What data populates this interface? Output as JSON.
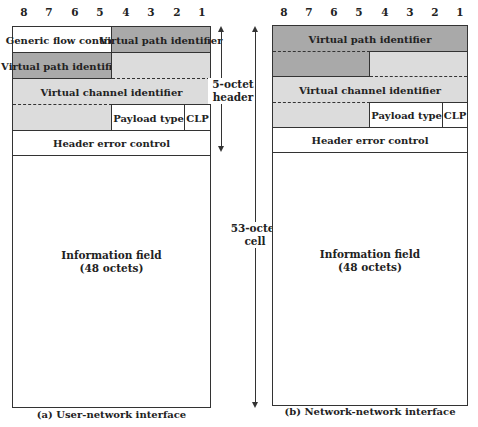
{
  "bit_labels": [
    "8",
    "7",
    "6",
    "5",
    "4",
    "3",
    "2",
    "1"
  ],
  "uni": {
    "fields": {
      "gfc": "Generic flow control",
      "vpi_a": "Virtual path identifier",
      "vpi_b": "Virtual path identifier",
      "vci": "Virtual channel identifier",
      "pt": "Payload type",
      "clp": "CLP",
      "hec": "Header error control",
      "info_line1": "Information field",
      "info_line2": "(48 octets)"
    },
    "caption": "(a) User-network interface"
  },
  "nni": {
    "fields": {
      "vpi": "Virtual path identifier",
      "vci": "Virtual channel identifier",
      "pt": "Payload type",
      "clp": "CLP",
      "hec": "Header error control",
      "info_line1": "Information field",
      "info_line2": "(48 octets)"
    },
    "caption": "(b) Network-network interface"
  },
  "annotations": {
    "header_line1": "5-octet",
    "header_line2": "header",
    "cell_line1": "53-octet",
    "cell_line2": "cell"
  },
  "colors": {
    "dark_field": "#a9a9a9",
    "light_field": "#dcdcdc"
  }
}
